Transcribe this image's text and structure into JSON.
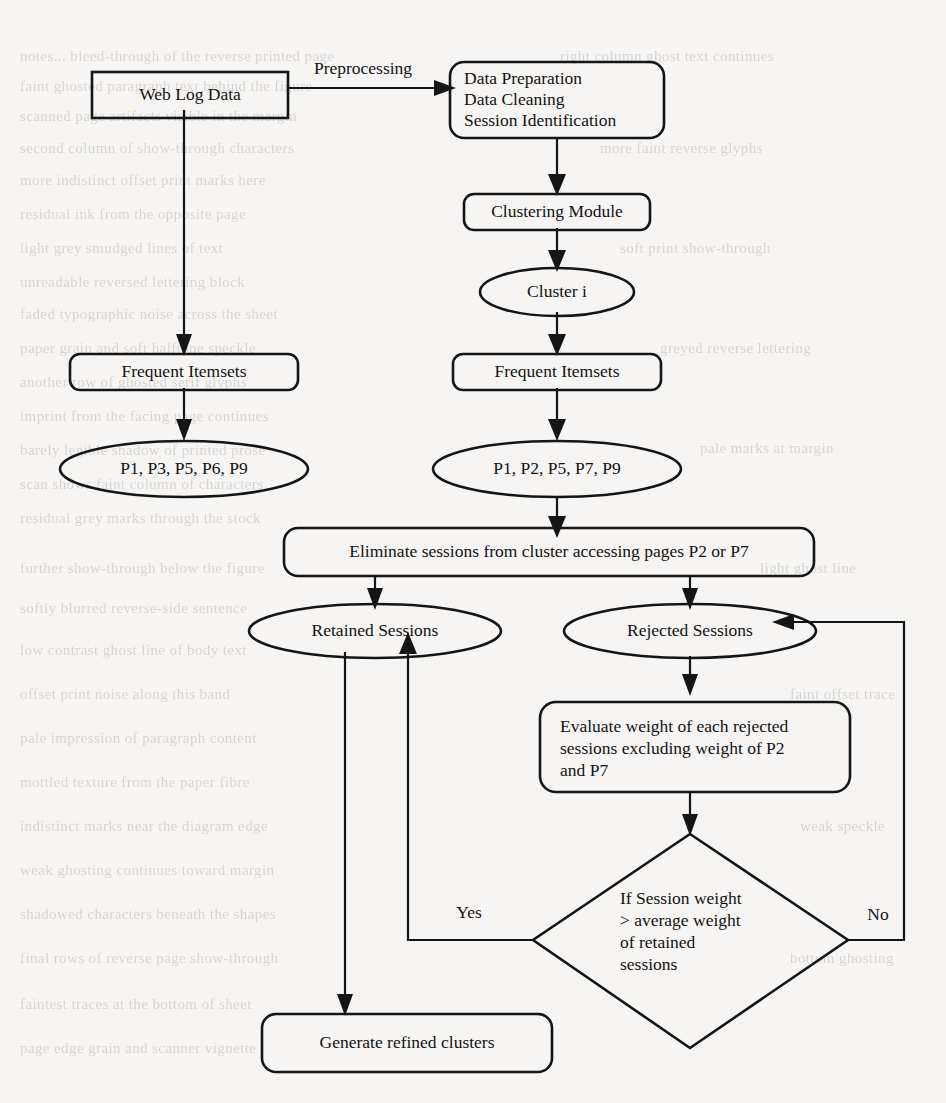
{
  "diagram": {
    "background_color": "#f6f5f3",
    "stroke_color": "#151515",
    "text_color": "#121212",
    "nodes": {
      "web_log_data": {
        "label": "Web Log Data",
        "shape": "rectangle"
      },
      "preprocessing_box": {
        "line1": "Data Preparation",
        "line2": "Data Cleaning",
        "line3": "Session Identification",
        "shape": "rounded-rectangle"
      },
      "clustering_module": {
        "label": "Clustering Module",
        "shape": "rounded-rectangle"
      },
      "cluster_i": {
        "label": "Cluster i",
        "shape": "ellipse"
      },
      "frequent_itemsets_left": {
        "label": "Frequent Itemsets",
        "shape": "rounded-rectangle"
      },
      "frequent_itemsets_right": {
        "label": "Frequent Itemsets",
        "shape": "rounded-rectangle"
      },
      "itemset_left": {
        "label": "P1, P3, P5, P6, P9",
        "shape": "ellipse"
      },
      "itemset_right": {
        "label": "P1, P2, P5, P7, P9",
        "shape": "ellipse"
      },
      "eliminate_sessions": {
        "label": "Eliminate sessions from cluster accessing pages P2 or P7",
        "shape": "rounded-rectangle"
      },
      "retained_sessions": {
        "label": "Retained Sessions",
        "shape": "ellipse"
      },
      "rejected_sessions": {
        "label": "Rejected Sessions",
        "shape": "ellipse"
      },
      "evaluate_weight": {
        "line1": "Evaluate weight of each rejected",
        "line2": "sessions excluding weight of P2",
        "line3": "and P7",
        "shape": "rounded-rectangle"
      },
      "decision": {
        "line1": "If Session weight",
        "line2": "> average weight",
        "line3": "of retained",
        "line4": "sessions",
        "shape": "diamond"
      },
      "generate_refined_clusters": {
        "label": "Generate refined clusters",
        "shape": "rounded-rectangle"
      }
    },
    "edge_labels": {
      "preprocessing": "Preprocessing",
      "yes": "Yes",
      "no": "No"
    },
    "ghost_text": [
      {
        "x": 20,
        "y": 48,
        "text": "notes... bleed-through of the reverse printed page"
      },
      {
        "x": 20,
        "y": 78,
        "text": "faint ghosted paragraph text behind the figure"
      },
      {
        "x": 20,
        "y": 108,
        "text": "scanned page artifacts visible in the margin"
      },
      {
        "x": 20,
        "y": 140,
        "text": "second column of show-through characters"
      },
      {
        "x": 20,
        "y": 172,
        "text": "more indistinct offset print marks here"
      },
      {
        "x": 20,
        "y": 206,
        "text": "residual ink from the opposite page"
      },
      {
        "x": 20,
        "y": 240,
        "text": "light grey smudged lines of text"
      },
      {
        "x": 20,
        "y": 274,
        "text": "unreadable reversed lettering block"
      },
      {
        "x": 20,
        "y": 306,
        "text": "faded typographic noise across the sheet"
      },
      {
        "x": 20,
        "y": 340,
        "text": "paper grain and soft halftone speckle"
      },
      {
        "x": 20,
        "y": 374,
        "text": "another row of ghosted serif glyphs"
      },
      {
        "x": 20,
        "y": 408,
        "text": "imprint from the facing page continues"
      },
      {
        "x": 20,
        "y": 442,
        "text": "barely legible shadow of printed prose"
      },
      {
        "x": 20,
        "y": 476,
        "text": "scan shows faint column of characters"
      },
      {
        "x": 20,
        "y": 510,
        "text": "residual grey marks through the stock"
      },
      {
        "x": 20,
        "y": 560,
        "text": "further show-through below the figure"
      },
      {
        "x": 20,
        "y": 600,
        "text": "softly blurred reverse-side sentence"
      },
      {
        "x": 20,
        "y": 642,
        "text": "low contrast ghost line of body text"
      },
      {
        "x": 20,
        "y": 686,
        "text": "offset print noise along this band"
      },
      {
        "x": 20,
        "y": 730,
        "text": "pale impression of paragraph content"
      },
      {
        "x": 20,
        "y": 774,
        "text": "mottled texture from the paper fibre"
      },
      {
        "x": 20,
        "y": 818,
        "text": "indistinct marks near the diagram edge"
      },
      {
        "x": 20,
        "y": 862,
        "text": "weak ghosting continues toward margin"
      },
      {
        "x": 20,
        "y": 906,
        "text": "shadowed characters beneath the shapes"
      },
      {
        "x": 20,
        "y": 950,
        "text": "final rows of reverse page show-through"
      },
      {
        "x": 20,
        "y": 996,
        "text": "faintest traces at the bottom of sheet"
      },
      {
        "x": 20,
        "y": 1040,
        "text": "page edge grain and scanner vignette"
      },
      {
        "x": 560,
        "y": 48,
        "text": "right column ghost text continues"
      },
      {
        "x": 600,
        "y": 140,
        "text": "more faint reverse glyphs"
      },
      {
        "x": 620,
        "y": 240,
        "text": "soft print show-through"
      },
      {
        "x": 660,
        "y": 340,
        "text": "greyed reverse lettering"
      },
      {
        "x": 700,
        "y": 440,
        "text": "pale marks at margin"
      },
      {
        "x": 760,
        "y": 560,
        "text": "light ghost line"
      },
      {
        "x": 790,
        "y": 686,
        "text": "faint offset trace"
      },
      {
        "x": 800,
        "y": 818,
        "text": "weak speckle"
      },
      {
        "x": 790,
        "y": 950,
        "text": "bottom ghosting"
      }
    ]
  }
}
